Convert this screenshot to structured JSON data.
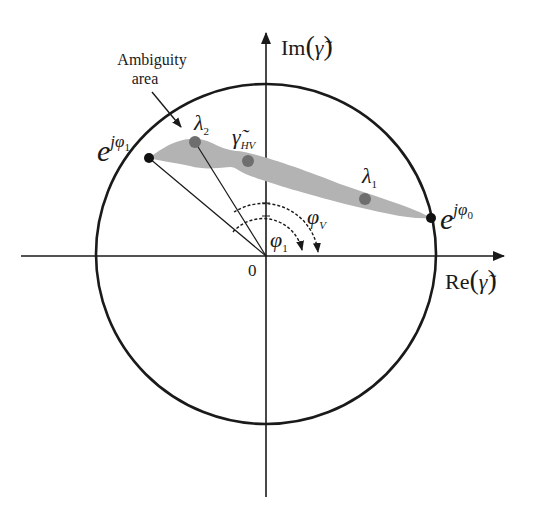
{
  "axes": {
    "x_label": "Re(γ̃)",
    "x_label_main": "Re",
    "x_label_arg": "γ̃",
    "y_label": "Im(γ̃)",
    "y_label_main": "Im",
    "y_label_arg": "γ̃",
    "origin_label": "0"
  },
  "annotation": {
    "line1": "Ambiguity",
    "line2": "area"
  },
  "points": {
    "phi1_point": {
      "base": "e",
      "exp": "jφ",
      "exp_sub": "1"
    },
    "phi0_point": {
      "base": "e",
      "exp": "jφ",
      "exp_sub": "0"
    },
    "lambda2": {
      "sym": "λ",
      "sub": "2"
    },
    "gamma_hv": {
      "sym": "γ̃",
      "sub": "HV"
    },
    "lambda1": {
      "sym": "λ",
      "sub": "1"
    }
  },
  "angles": {
    "phi1": {
      "sym": "φ",
      "sub": "1"
    },
    "phiV": {
      "sym": "φ",
      "sub": "V"
    }
  },
  "colors": {
    "stroke": "#1a1a1a",
    "region_fill": "#b3b3b3",
    "dot_fill": "#6e6e6e",
    "background": "#ffffff"
  }
}
